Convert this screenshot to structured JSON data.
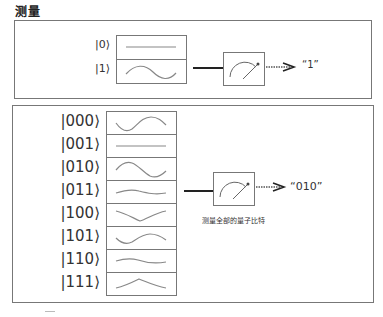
{
  "title": "测量",
  "single_qubit": {
    "states": [
      {
        "label": "|0⟩",
        "wave": "flat"
      },
      {
        "label": "|1⟩",
        "wave": "sine"
      }
    ],
    "meter_icon": "measurement-meter-icon",
    "output": "“1”"
  },
  "three_qubit": {
    "states": [
      {
        "label": "|000⟩",
        "wave": "sine-rising"
      },
      {
        "label": "|001⟩",
        "wave": "flat"
      },
      {
        "label": "|010⟩",
        "wave": "sine-falling"
      },
      {
        "label": "|011⟩",
        "wave": "gentle"
      },
      {
        "label": "|100⟩",
        "wave": "dip"
      },
      {
        "label": "|101⟩",
        "wave": "sine-rising-small"
      },
      {
        "label": "|110⟩",
        "wave": "gentle"
      },
      {
        "label": "|111⟩",
        "wave": "peak"
      }
    ],
    "meter_icon": "measurement-meter-icon",
    "output": "“010”",
    "caption": "测量全部的量子比特"
  },
  "colors": {
    "border": "#777777",
    "wave": "#888888",
    "wire": "#222222",
    "text": "#333333"
  }
}
